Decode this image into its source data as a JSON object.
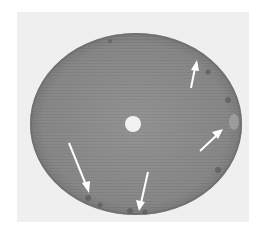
{
  "image": {
    "description": "Grayscale photograph of a circular disc with a central hole; white arrows point to darker defect spots along the rim",
    "colors": {
      "background": "#ffffff",
      "photo_panel": "#efefef",
      "disc": "#8a8a8a",
      "disc_edge": "#6e6e6e",
      "center_hole": "#f2f2f2",
      "arrow": "#ffffff"
    },
    "arrows": [
      {
        "id": "arrow-upper-right",
        "from": [
          192,
          88
        ],
        "to": [
          197,
          60
        ]
      },
      {
        "id": "arrow-right",
        "from": [
          200,
          151
        ],
        "to": [
          223,
          129
        ]
      },
      {
        "id": "arrow-lower-left",
        "from": [
          69,
          143
        ],
        "to": [
          89,
          193
        ]
      },
      {
        "id": "arrow-bottom",
        "from": [
          148,
          172
        ],
        "to": [
          139,
          211
        ]
      }
    ]
  }
}
